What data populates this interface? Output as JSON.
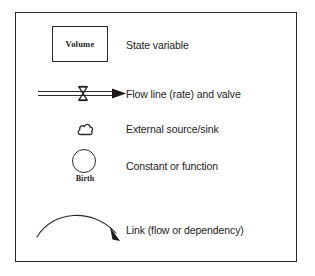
{
  "diagram": {
    "border_color": "#2b2b2b",
    "background": "#ffffff",
    "ink_color": "#1c1c1c",
    "rows": [
      {
        "symbol": "rectangle-box",
        "symbol_label": "Volume",
        "description": "State variable"
      },
      {
        "symbol": "double-flow-line-with-valve-and-arrowhead",
        "symbol_label": "",
        "description": "Flow line (rate) and valve"
      },
      {
        "symbol": "cloud",
        "symbol_label": "",
        "description": "External source/sink"
      },
      {
        "symbol": "circle",
        "symbol_label": "Birth",
        "description": "Constant or function"
      },
      {
        "symbol": "curved-arrow",
        "symbol_label": "",
        "description": "Link (flow or dependency)"
      }
    ]
  }
}
